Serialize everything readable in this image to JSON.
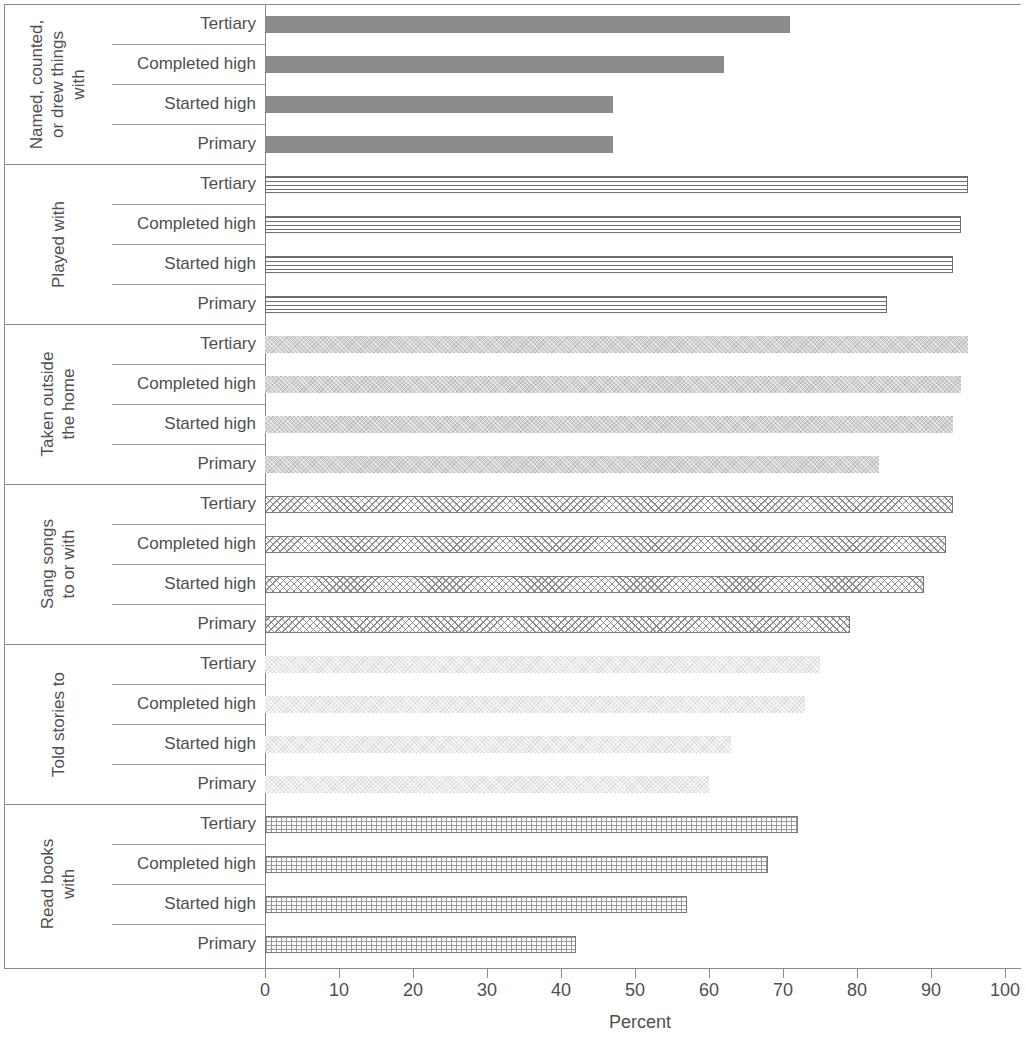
{
  "chart_data": {
    "type": "bar",
    "orientation": "horizontal",
    "title": "",
    "xlabel": "Percent",
    "ylabel": "",
    "xlim": [
      0,
      100
    ],
    "xticks": [
      0,
      10,
      20,
      30,
      40,
      50,
      60,
      70,
      80,
      90,
      100
    ],
    "xtick_labels": [
      "0",
      "10",
      "20",
      "30",
      "40",
      "50",
      "60",
      "70",
      "80",
      "90",
      "100"
    ],
    "grid": false,
    "legend": "none",
    "categories": [
      "Tertiary",
      "Completed high",
      "Started high",
      "Primary"
    ],
    "groups": [
      {
        "name": "Named, counted,\nor drew things\nwith",
        "fill": "solid-dark-gray",
        "values": [
          71,
          62,
          47,
          47
        ]
      },
      {
        "name": "Played with",
        "fill": "horizontal-lines",
        "values": [
          95,
          94,
          93,
          84
        ]
      },
      {
        "name": "Taken outside\nthe home",
        "fill": "mid-gray-speckle",
        "values": [
          95,
          94,
          93,
          83
        ]
      },
      {
        "name": "Sang songs\nto or with",
        "fill": "crosshatch",
        "values": [
          93,
          92,
          89,
          79
        ]
      },
      {
        "name": "Told stories to",
        "fill": "light-speckle",
        "values": [
          75,
          73,
          63,
          60
        ]
      },
      {
        "name": "Read books\nwith",
        "fill": "grid-mesh",
        "values": [
          72,
          68,
          57,
          42
        ]
      }
    ]
  },
  "colors": {
    "solid_bar": "#8b8b8b",
    "axis": "#8a8a8a",
    "text": "#4f4f4f",
    "background": "#ffffff"
  }
}
